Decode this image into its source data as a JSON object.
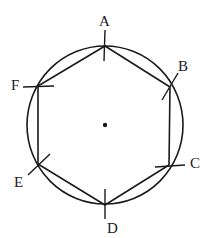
{
  "diagram": {
    "center": {
      "x": 105,
      "y": 125
    },
    "circle_radius": 78,
    "stroke_color": "#1a1a1a",
    "vertices": [
      {
        "label": "A",
        "x": 105,
        "y": 46
      },
      {
        "label": "B",
        "x": 170,
        "y": 87
      },
      {
        "label": "C",
        "x": 169,
        "y": 165
      },
      {
        "label": "D",
        "x": 105,
        "y": 205
      },
      {
        "label": "E",
        "x": 38,
        "y": 164
      },
      {
        "label": "F",
        "x": 38,
        "y": 86
      }
    ]
  }
}
